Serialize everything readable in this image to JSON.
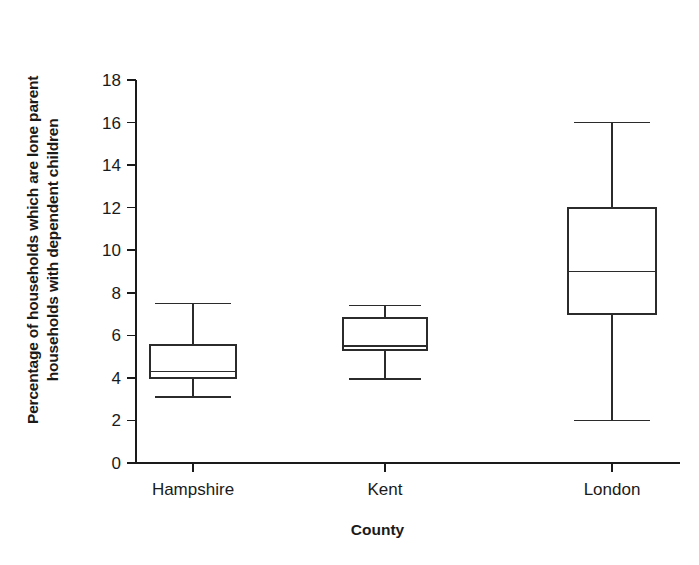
{
  "chart_data": {
    "type": "box",
    "title": "",
    "xlabel": "County",
    "ylabel": "Percentage of households which are lone parent households with dependent children",
    "ylabel_lines": [
      "Percentage of households which are lone parent",
      "households with dependent children"
    ],
    "categories": [
      "Hampshire",
      "Kent",
      "London"
    ],
    "ylim": [
      0,
      18
    ],
    "yticks": [
      0,
      2,
      4,
      6,
      8,
      10,
      12,
      14,
      16,
      18
    ],
    "ytick_labels": [
      "0",
      "2",
      "4",
      "6",
      "8",
      "10",
      "12",
      "14",
      "16",
      "18"
    ],
    "grid": false,
    "legend": "none",
    "series": [
      {
        "name": "Hampshire",
        "whisker_low": 3.1,
        "q1": 4.0,
        "median": 4.3,
        "q3": 5.55,
        "whisker_high": 7.5
      },
      {
        "name": "Kent",
        "whisker_low": 3.95,
        "q1": 5.3,
        "median": 5.5,
        "q3": 6.8,
        "whisker_high": 7.4
      },
      {
        "name": "London",
        "whisker_low": 2.0,
        "q1": 7.0,
        "median": 9.0,
        "q3": 12.0,
        "whisker_high": 16.0
      }
    ],
    "colors": {
      "axis": "#1a1a1a",
      "box_stroke": "#2b2b2b",
      "box_fill": "#ffffff",
      "text": "#1a1a1a"
    }
  }
}
